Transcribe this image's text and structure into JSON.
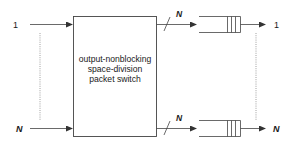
{
  "diagram": {
    "switch_box": {
      "lines": [
        "output-nonblocking",
        "space-division",
        "packet switch"
      ]
    },
    "inputs": [
      {
        "label": "1"
      },
      {
        "label": "N"
      }
    ],
    "outputs": [
      {
        "bus_label": "N",
        "label": "1"
      },
      {
        "bus_label": "N",
        "label": "N"
      }
    ],
    "colors": {
      "stroke": "#333333",
      "dotted": "#777777",
      "background": "#ffffff"
    }
  }
}
